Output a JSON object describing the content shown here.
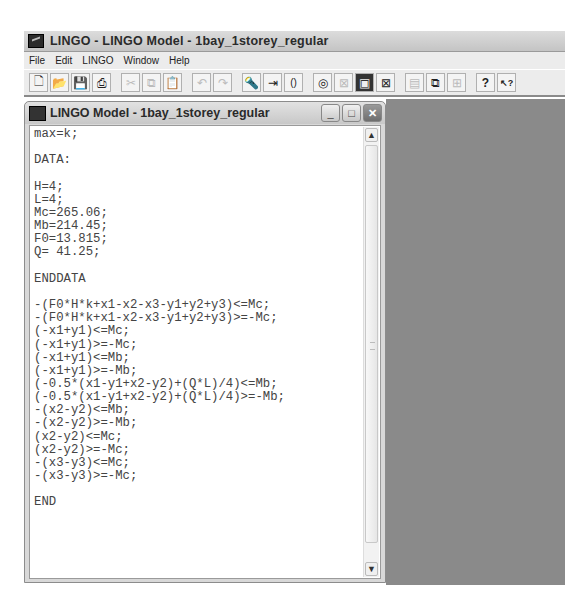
{
  "app": {
    "title": "LINGO - LINGO Model - 1bay_1storey_regular",
    "icon": "lingo-app-icon"
  },
  "menubar": {
    "items": [
      "File",
      "Edit",
      "LINGO",
      "Window",
      "Help"
    ]
  },
  "toolbar": {
    "buttons": [
      {
        "name": "new-icon",
        "glyph": "🗋",
        "enabled": true
      },
      {
        "name": "open-icon",
        "glyph": "📂",
        "enabled": true
      },
      {
        "name": "save-icon",
        "glyph": "💾",
        "enabled": true
      },
      {
        "name": "print-icon",
        "glyph": "⎙",
        "enabled": true
      },
      {
        "name": "cut-icon",
        "glyph": "✂",
        "enabled": false
      },
      {
        "name": "copy-icon",
        "glyph": "⧉",
        "enabled": false
      },
      {
        "name": "paste-icon",
        "glyph": "📋",
        "enabled": true
      },
      {
        "name": "undo-icon",
        "glyph": "↶",
        "enabled": false
      },
      {
        "name": "redo-icon",
        "glyph": "↷",
        "enabled": false
      },
      {
        "name": "find-icon",
        "glyph": "🔦",
        "enabled": true
      },
      {
        "name": "goto-line-icon",
        "glyph": "⇥",
        "enabled": true
      },
      {
        "name": "match-parenthesis-icon",
        "glyph": "()",
        "enabled": true
      },
      {
        "name": "solve-icon",
        "glyph": "◎",
        "enabled": true
      },
      {
        "name": "solution-icon",
        "glyph": "⊠",
        "enabled": false
      },
      {
        "name": "options-icon",
        "glyph": "▣",
        "enabled": true
      },
      {
        "name": "close-all-icon",
        "glyph": "⊠",
        "enabled": true
      },
      {
        "name": "tile-icon",
        "glyph": "▤",
        "enabled": false
      },
      {
        "name": "cascade-icon",
        "glyph": "⧉",
        "enabled": true
      },
      {
        "name": "arrange-icon",
        "glyph": "⊞",
        "enabled": false
      },
      {
        "name": "help-icon",
        "glyph": "?",
        "enabled": true
      },
      {
        "name": "context-help-icon",
        "glyph": "↖?",
        "enabled": true
      }
    ]
  },
  "child_window": {
    "title": "LINGO Model - 1bay_1storey_regular",
    "buttons": {
      "minimize": "_",
      "maximize": "□",
      "close": "✕"
    }
  },
  "editor": {
    "lines": [
      "max=k;",
      "",
      "DATA:",
      "",
      "H=4;",
      "L=4;",
      "Mc=265.06;",
      "Mb=214.45;",
      "F0=13.815;",
      "Q= 41.25;",
      "",
      "ENDDATA",
      "",
      "-(F0*H*k+x1-x2-x3-y1+y2+y3)<=Mc;",
      "-(F0*H*k+x1-x2-x3-y1+y2+y3)>=-Mc;",
      "(-x1+y1)<=Mc;",
      "(-x1+y1)>=-Mc;",
      "(-x1+y1)<=Mb;",
      "(-x1+y1)>=-Mb;",
      "(-0.5*(x1-y1+x2-y2)+(Q*L)/4)<=Mb;",
      "(-0.5*(x1-y1+x2-y2)+(Q*L)/4)>=-Mb;",
      "-(x2-y2)<=Mb;",
      "-(x2-y2)>=-Mb;",
      "(x2-y2)<=Mc;",
      "(x2-y2)>=-Mc;",
      "-(x3-y3)<=Mc;",
      "-(x3-y3)>=-Mc;",
      "",
      "END"
    ],
    "scrollbar": {
      "up": "▲",
      "down": "▼"
    }
  }
}
